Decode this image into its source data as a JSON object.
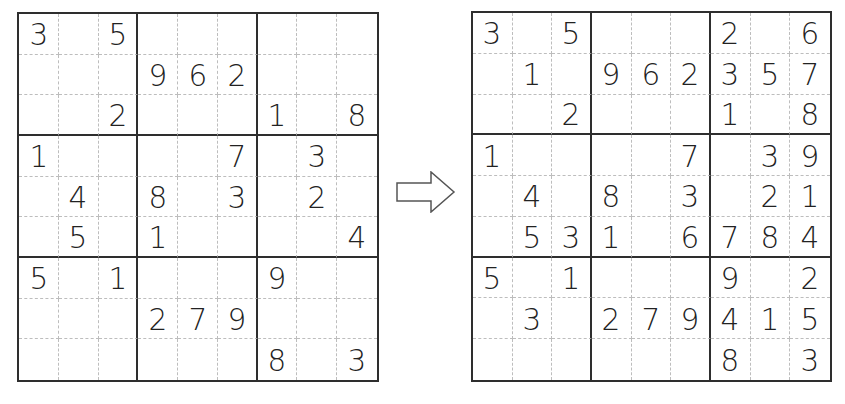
{
  "puzzle": {
    "name": "sudoku-puzzle",
    "grid": [
      [
        "3",
        "",
        "5",
        "",
        "",
        "",
        "",
        "",
        ""
      ],
      [
        "",
        "",
        "",
        "9",
        "6",
        "2",
        "",
        "",
        ""
      ],
      [
        "",
        "",
        "2",
        "",
        "",
        "",
        "1",
        "",
        "8"
      ],
      [
        "1",
        "",
        "",
        "",
        "",
        "7",
        "",
        "3",
        ""
      ],
      [
        "",
        "4",
        "",
        "8",
        "",
        "3",
        "",
        "2",
        ""
      ],
      [
        "",
        "5",
        "",
        "1",
        "",
        "",
        "",
        "",
        "4"
      ],
      [
        "5",
        "",
        "1",
        "",
        "",
        "",
        "9",
        "",
        ""
      ],
      [
        "",
        "",
        "",
        "2",
        "7",
        "9",
        "",
        "",
        ""
      ],
      [
        "",
        "",
        "",
        "",
        "",
        "",
        "8",
        "",
        "3"
      ]
    ]
  },
  "solution": {
    "name": "sudoku-partial-solution",
    "grid": [
      [
        "3",
        "",
        "5",
        "",
        "",
        "",
        "2",
        "",
        "6"
      ],
      [
        "",
        "1",
        "",
        "9",
        "6",
        "2",
        "3",
        "5",
        "7"
      ],
      [
        "",
        "",
        "2",
        "",
        "",
        "",
        "1",
        "",
        "8"
      ],
      [
        "1",
        "",
        "",
        "",
        "",
        "7",
        "",
        "3",
        "9"
      ],
      [
        "",
        "4",
        "",
        "8",
        "",
        "3",
        "",
        "2",
        "1"
      ],
      [
        "",
        "5",
        "3",
        "1",
        "",
        "6",
        "7",
        "8",
        "4"
      ],
      [
        "5",
        "",
        "1",
        "",
        "",
        "",
        "9",
        "",
        "2"
      ],
      [
        "",
        "3",
        "",
        "2",
        "7",
        "9",
        "4",
        "1",
        "5"
      ],
      [
        "",
        "",
        "",
        "",
        "",
        "",
        "8",
        "",
        "3"
      ]
    ]
  },
  "arrow": {
    "icon": "right-arrow-icon",
    "stroke_color": "#555555",
    "fill_color": "#ffffff"
  },
  "colors": {
    "digit": "#222222",
    "box_line": "#2e2e2e",
    "cell_line": "#bdbdbd",
    "background": "#ffffff"
  }
}
